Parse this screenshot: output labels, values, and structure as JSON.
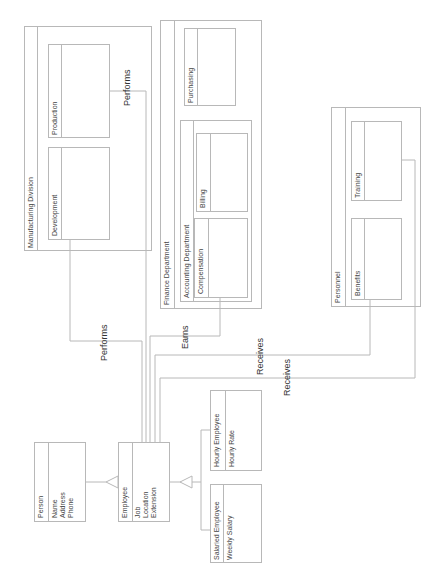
{
  "diagram": {
    "classes": {
      "person": {
        "name": "Person",
        "attributes": [
          "Name",
          "Address",
          "Phone"
        ]
      },
      "employee": {
        "name": "Employee",
        "attributes": [
          "Job",
          "Location",
          "Extension"
        ]
      },
      "salaried": {
        "name": "Salaried Employee",
        "attributes": [
          "Weekly Salary"
        ]
      },
      "hourly": {
        "name": "Hourly Employee",
        "attributes": [
          "Hourly Rate"
        ]
      }
    },
    "containers": {
      "manufacturing": {
        "name": "Manufacturing Division",
        "children": {
          "development": "Development",
          "production": "Production"
        }
      },
      "finance": {
        "name": "Finance Department",
        "children": {
          "purchasing": "Purchasing",
          "accounting": {
            "name": "Accounting Department",
            "compensation": "Compensation",
            "billing": "Billing"
          }
        }
      },
      "personnel": {
        "name": "Personnel",
        "children": {
          "benefits": "Benefits",
          "training": "Training"
        }
      }
    },
    "relationships": {
      "performs_development": "Performs",
      "performs_production": "Performs",
      "earns": "Earns",
      "receives_benefits": "Receives",
      "receives_training": "Receives"
    },
    "colors": {
      "line": "#b8b8b8",
      "text": "#333333",
      "background": "#ffffff"
    }
  }
}
